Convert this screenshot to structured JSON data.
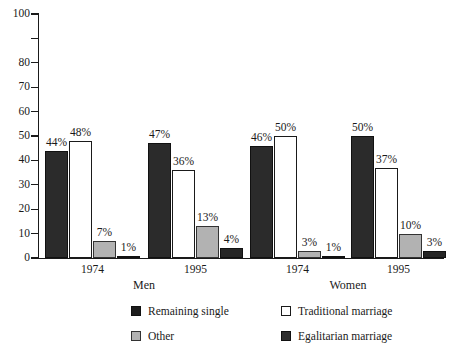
{
  "chart_data": {
    "type": "bar",
    "title": "",
    "subtitle": "",
    "xlabel": "",
    "ylabel": "",
    "ylim": [
      0,
      100
    ],
    "y_ticks": [
      0,
      10,
      20,
      30,
      40,
      50,
      60,
      70,
      80,
      90,
      100
    ],
    "y_tick_labels": [
      "0",
      "10",
      "20",
      "30",
      "40",
      "50",
      "60",
      "70",
      "80",
      "",
      "100"
    ],
    "grid": false,
    "legend_position": "bottom",
    "value_suffix": "%",
    "categories": [
      "1974",
      "1995",
      "1974",
      "1995"
    ],
    "group_labels": [
      "Men",
      "Women"
    ],
    "groups": [
      {
        "gender": "Men",
        "year": "1974",
        "bars": [
          {
            "series": "Remaining single",
            "value": 44,
            "label": "44%"
          },
          {
            "series": "Traditional marriage",
            "value": 48,
            "label": "48%"
          },
          {
            "series": "Other",
            "value": 7,
            "label": "7%"
          },
          {
            "series": "Egalitarian marriage",
            "value": 1,
            "label": "1%"
          }
        ]
      },
      {
        "gender": "Men",
        "year": "1995",
        "bars": [
          {
            "series": "Remaining single",
            "value": 47,
            "label": "47%"
          },
          {
            "series": "Traditional marriage",
            "value": 36,
            "label": "36%"
          },
          {
            "series": "Other",
            "value": 13,
            "label": "13%"
          },
          {
            "series": "Egalitarian marriage",
            "value": 4,
            "label": "4%"
          }
        ]
      },
      {
        "gender": "Women",
        "year": "1974",
        "bars": [
          {
            "series": "Remaining single",
            "value": 46,
            "label": "46%"
          },
          {
            "series": "Traditional marriage",
            "value": 50,
            "label": "50%"
          },
          {
            "series": "Other",
            "value": 3,
            "label": "3%"
          },
          {
            "series": "Egalitarian marriage",
            "value": 1,
            "label": "1%"
          }
        ]
      },
      {
        "gender": "Women",
        "year": "1995",
        "bars": [
          {
            "series": "Remaining single",
            "value": 50,
            "label": "50%"
          },
          {
            "series": "Traditional marriage",
            "value": 37,
            "label": "37%"
          },
          {
            "series": "Other",
            "value": 10,
            "label": "10%"
          },
          {
            "series": "Egalitarian marriage",
            "value": 3,
            "label": "3%"
          }
        ]
      }
    ],
    "series": [
      {
        "name": "Remaining single",
        "color": "#1d1d1d",
        "values": [
          44,
          47,
          46,
          50
        ]
      },
      {
        "name": "Traditional marriage",
        "color": "#ffffff",
        "values": [
          48,
          36,
          50,
          37
        ]
      },
      {
        "name": "Other",
        "color": "#b2b2b2",
        "values": [
          7,
          13,
          3,
          10
        ]
      },
      {
        "name": "Egalitarian marriage",
        "color": "#2e2e2e",
        "values": [
          1,
          4,
          1,
          3
        ]
      }
    ],
    "legend": [
      {
        "label": "Remaining single",
        "color": "#1d1d1d"
      },
      {
        "label": "Traditional marriage",
        "color": "#ffffff"
      },
      {
        "label": "Other",
        "color": "#b2b2b2"
      },
      {
        "label": "Egalitarian marriage",
        "color": "#2e2e2e"
      }
    ]
  }
}
